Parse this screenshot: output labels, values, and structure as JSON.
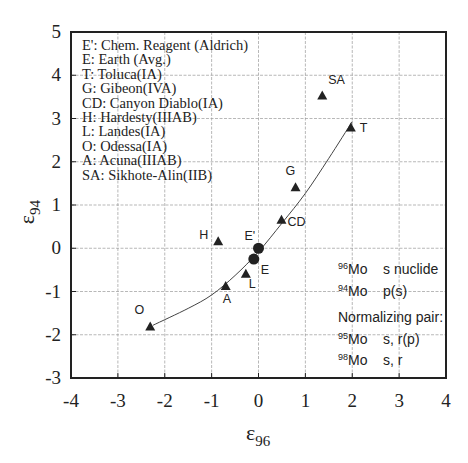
{
  "chart_data": {
    "type": "scatter",
    "title": "",
    "xlabel": "ε96",
    "ylabel": "ε94",
    "xlabel_main": "ε",
    "xlabel_sub": "96",
    "ylabel_main": "ε",
    "ylabel_sub": "94",
    "xlim": [
      -4,
      4
    ],
    "ylim": [
      -3,
      5
    ],
    "grid": true,
    "xticks": [
      "-4",
      "-3",
      "-2",
      "-1",
      "0",
      "1",
      "2",
      "3",
      "4"
    ],
    "yticks": [
      "5",
      "4",
      "3",
      "2",
      "1",
      "0",
      "-1",
      "-2",
      "-3"
    ],
    "series": [
      {
        "name": "Meteorites (triangles)",
        "marker": "triangle",
        "points": [
          {
            "label": "SA",
            "x": 1.36,
            "y": 3.53
          },
          {
            "label": "T",
            "x": 1.97,
            "y": 2.79
          },
          {
            "label": "G",
            "x": 0.79,
            "y": 1.41
          },
          {
            "label": "CD",
            "x": 0.49,
            "y": 0.66
          },
          {
            "label": "H",
            "x": -0.86,
            "y": 0.16
          },
          {
            "label": "L",
            "x": -0.27,
            "y": -0.59
          },
          {
            "label": "A",
            "x": -0.7,
            "y": -0.87
          },
          {
            "label": "O",
            "x": -2.31,
            "y": -1.81
          }
        ]
      },
      {
        "name": "Terrestrial standards (circles)",
        "marker": "circle",
        "points": [
          {
            "label": "E'",
            "x": 0.0,
            "y": 0.0
          },
          {
            "label": "E",
            "x": -0.1,
            "y": -0.25
          }
        ]
      },
      {
        "name": "Mixing curve",
        "type": "line",
        "x": [
          -2.25,
          -1.5,
          -1.0,
          -0.5,
          0.0,
          0.5,
          1.0,
          1.5,
          2.0
        ],
        "y": [
          -1.78,
          -1.39,
          -1.08,
          -0.63,
          -0.08,
          0.58,
          1.27,
          2.08,
          2.93
        ]
      }
    ],
    "legend": {
      "position": "upper-left",
      "entries": [
        "E':  Chem. Reagent (Aldrich)",
        "E: Earth (Avg.)",
        "T: Toluca(IA)",
        "G: Gibeon(IVA)",
        "CD: Canyon Diablo(IA)",
        "H: Hardesty(IIIAB)",
        "L: Landes(IA)",
        "O: Odessa(IA)",
        "A: Acuna(IIIAB)",
        "SA: Sikhote-Alin(IIB)"
      ]
    },
    "annotation": {
      "lines": [
        {
          "sup": "96",
          "iso": "Mo",
          "desc": "s nuclide"
        },
        {
          "sup": "94",
          "iso": "Mo",
          "desc": "p(s)"
        }
      ],
      "normalizing_title": "Normalizing pair:",
      "normalizing": [
        {
          "sup": "95",
          "iso": "Mo",
          "desc": "s, r(p)"
        },
        {
          "sup": "98",
          "iso": "Mo",
          "desc": "s, r"
        }
      ]
    }
  }
}
